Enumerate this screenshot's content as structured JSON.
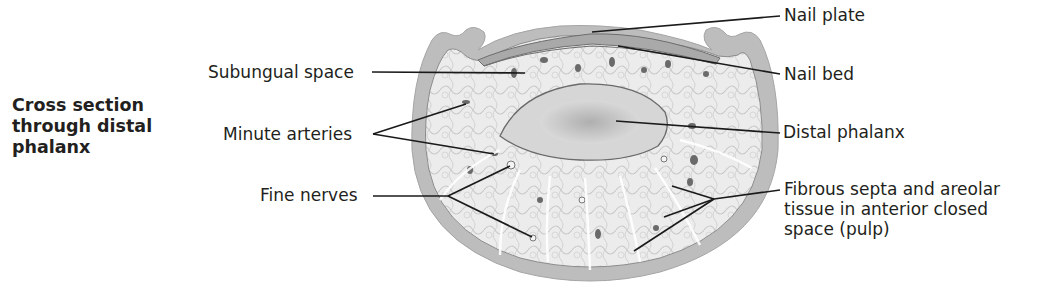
{
  "figure": {
    "title": "Cross section\nthrough distal\nphalanx"
  },
  "labels": {
    "left": [
      {
        "id": "subungual-space",
        "text": "Subungual space"
      },
      {
        "id": "minute-arteries",
        "text": "Minute arteries"
      },
      {
        "id": "fine-nerves",
        "text": "Fine nerves"
      }
    ],
    "right": [
      {
        "id": "nail-plate",
        "text": "Nail plate"
      },
      {
        "id": "nail-bed",
        "text": "Nail bed"
      },
      {
        "id": "distal-phalanx",
        "text": "Distal phalanx"
      },
      {
        "id": "fibrous-septa",
        "text": "Fibrous septa and areolar\ntissue in anterior closed\nspace (pulp)"
      }
    ]
  },
  "colors": {
    "skin": "#b9b9b9",
    "pulp": "#ececec",
    "bone": "#dcdcdc",
    "leader": "#1a1a1a"
  }
}
